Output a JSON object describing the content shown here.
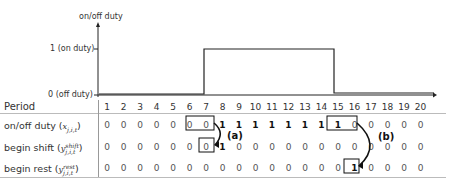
{
  "chart": {
    "y_axis_title": "on/off duty",
    "y_tick_on": "1 (on duty)",
    "y_tick_off": "0 (off duty)",
    "on_start_period": 8,
    "on_end_period": 15
  },
  "table": {
    "header_label": "Period",
    "periods": [
      "1",
      "2",
      "3",
      "4",
      "5",
      "6",
      "7",
      "8",
      "9",
      "10",
      "11",
      "12",
      "13",
      "14",
      "15",
      "16",
      "17",
      "18",
      "19",
      "20"
    ],
    "rows": [
      {
        "label": "on/off duty (",
        "var": "x",
        "sub": "j,i,t",
        "sup": "",
        "close": ")",
        "values": [
          "0",
          "0",
          "0",
          "0",
          "0",
          "0",
          "0",
          "1",
          "1",
          "1",
          "1",
          "1",
          "1",
          "1",
          "1",
          "0",
          "0",
          "0",
          "0",
          "0"
        ]
      },
      {
        "label": "begin shift (",
        "var": "y",
        "sub": "j,i,t",
        "sup": "shift",
        "close": ")",
        "values": [
          "0",
          "0",
          "0",
          "0",
          "0",
          "0",
          "0",
          "1",
          "0",
          "0",
          "0",
          "0",
          "0",
          "0",
          "0",
          "0",
          "0",
          "0",
          "0",
          "0"
        ]
      },
      {
        "label": "begin rest (",
        "var": "y",
        "sub": "j,i,t",
        "sup": "rest",
        "close": ")",
        "values": [
          "0",
          "0",
          "0",
          "0",
          "0",
          "0",
          "0",
          "0",
          "0",
          "0",
          "0",
          "0",
          "0",
          "0",
          "0",
          "1",
          "0",
          "0",
          "0",
          "0"
        ]
      }
    ]
  },
  "annotations": {
    "a": "(a)",
    "b": "(b)"
  }
}
